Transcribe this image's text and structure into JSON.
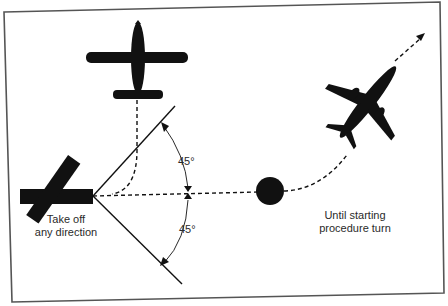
{
  "diagram": {
    "labels": {
      "takeoff_line1": "Take off",
      "takeoff_line2": "any direction",
      "angle_upper": "45°",
      "angle_lower": "45°",
      "procedure_line1": "Until starting",
      "procedure_line2": "procedure turn"
    },
    "elements": {
      "runway": "runway-bar",
      "top_aircraft": "airplane-top-view-icon",
      "departing_aircraft": "jet-airplane-icon",
      "fix": "navigation-fix-dot",
      "arrow": "arrowhead-icon"
    },
    "colors": {
      "ink": "#111111",
      "frame": "#555555",
      "background": "#ffffff"
    }
  }
}
